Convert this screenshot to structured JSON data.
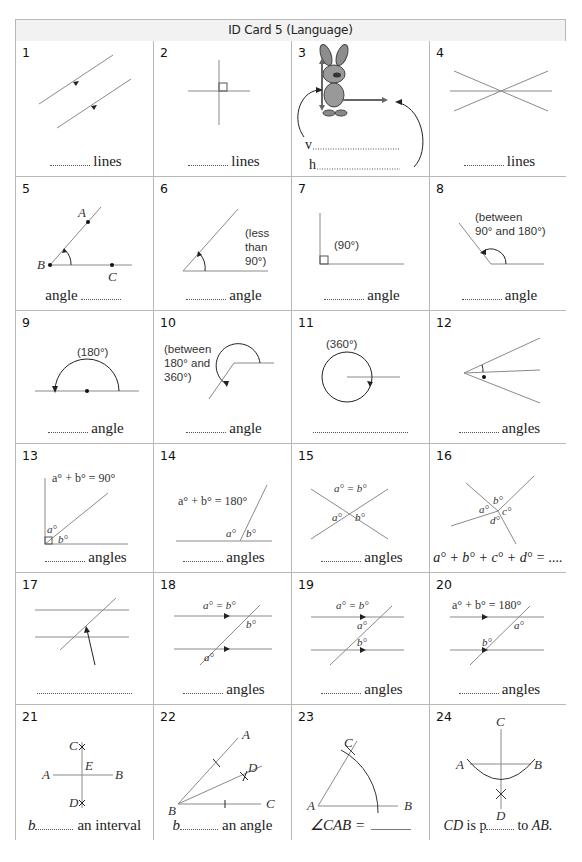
{
  "title": "ID Card 5 (Language)",
  "colors": {
    "border": "#b8b8b8",
    "header_bg": "#f2f2f2",
    "line": "#8a8a8a",
    "ink": "#222222"
  },
  "cells": [
    {
      "n": "1",
      "caption_after": "lines",
      "blank": "before"
    },
    {
      "n": "2",
      "caption_after": "lines",
      "blank": "before"
    },
    {
      "n": "3",
      "lines": [
        "v",
        "h"
      ],
      "image": "rabbit-holding-arrows"
    },
    {
      "n": "4",
      "caption_after": "lines",
      "blank": "before"
    },
    {
      "n": "5",
      "caption_before": "angle",
      "blank": "after",
      "labels": [
        "A",
        "B",
        "C"
      ]
    },
    {
      "n": "6",
      "caption_after": "angle",
      "blank": "before",
      "note": [
        "(less",
        "than",
        "90°)"
      ]
    },
    {
      "n": "7",
      "caption_after": "angle",
      "blank": "before",
      "note": [
        "(90°)"
      ]
    },
    {
      "n": "8",
      "caption_after": "angle",
      "blank": "before",
      "note": [
        "(between",
        "90° and 180°)"
      ]
    },
    {
      "n": "9",
      "caption_after": "angle",
      "blank": "before",
      "note": [
        "(180°)"
      ]
    },
    {
      "n": "10",
      "caption_after": "angle",
      "blank": "before",
      "note": [
        "(between",
        "180° and",
        "360°)"
      ]
    },
    {
      "n": "11",
      "caption_after": "",
      "blank": "only",
      "note": [
        "(360°)"
      ]
    },
    {
      "n": "12",
      "caption_after": "angles",
      "blank": "before"
    },
    {
      "n": "13",
      "caption_after": "angles",
      "blank": "before",
      "formula": "a° + b° = 90°",
      "labels": [
        "a°",
        "b°"
      ]
    },
    {
      "n": "14",
      "caption_after": "angles",
      "blank": "before",
      "formula": "a° + b° = 180°",
      "labels": [
        "a°",
        "b°"
      ]
    },
    {
      "n": "15",
      "caption_after": "angles",
      "blank": "before",
      "formula": "a° = b°",
      "labels": [
        "a°",
        "b°"
      ]
    },
    {
      "n": "16",
      "caption": "a° + b° + c° + d° = ....",
      "labels": [
        "a°",
        "b°",
        "c°",
        "d°"
      ]
    },
    {
      "n": "17",
      "caption_after": "",
      "blank": "only"
    },
    {
      "n": "18",
      "caption_after": "angles",
      "blank": "before",
      "formula": "a° = b°",
      "labels": [
        "a°",
        "b°"
      ]
    },
    {
      "n": "19",
      "caption_after": "angles",
      "blank": "before",
      "formula": "a° = b°",
      "labels": [
        "a°",
        "b°"
      ]
    },
    {
      "n": "20",
      "caption_after": "angles",
      "blank": "before",
      "formula": "a° + b° = 180°",
      "labels": [
        "a°",
        "b°"
      ]
    },
    {
      "n": "21",
      "caption_prefix": "b",
      "caption_after": "an interval",
      "labels": [
        "C",
        "A",
        "E",
        "B",
        "D"
      ]
    },
    {
      "n": "22",
      "caption_prefix": "b",
      "caption_after": "an angle",
      "labels": [
        "A",
        "D",
        "B",
        "C"
      ]
    },
    {
      "n": "23",
      "caption_prefix": "∠CAB =",
      "labels": [
        "C",
        "A",
        "B"
      ]
    },
    {
      "n": "24",
      "caption_prefix": "CD",
      "caption_mid": "is p",
      "caption_after": "to",
      "caption_end": "AB.",
      "labels": [
        "C",
        "A",
        "B",
        "D"
      ]
    }
  ]
}
